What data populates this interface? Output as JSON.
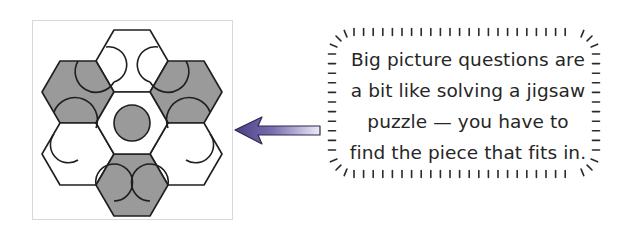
{
  "figure": {
    "colors": {
      "hex_fill_shaded": "#9a9a9a",
      "hex_fill_white": "#ffffff",
      "stroke": "#1f1f1f",
      "frame_border": "#d9d9d9",
      "arrow_dark": "#4b3f86",
      "arrow_light": "#e6e3f3",
      "text": "#262626"
    },
    "puzzle": {
      "center_piece": "white hexagon with shaded circle",
      "shaded_hexes": [
        "upper-left",
        "upper-right",
        "bottom"
      ],
      "white_hexes": [
        "top",
        "lower-left",
        "lower-right",
        "center"
      ]
    }
  },
  "callout": {
    "lines": [
      "Big picture questions are",
      "a bit like solving a jigsaw",
      "puzzle — you  have to",
      "find the piece that fits in."
    ]
  },
  "icons": {
    "arrow": "left-arrow-icon"
  }
}
